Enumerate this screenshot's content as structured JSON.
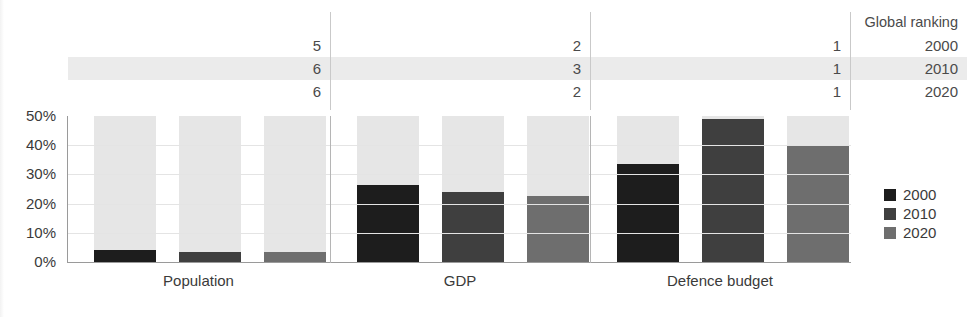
{
  "ranking_table": {
    "header_label": "Global ranking",
    "row_labels": [
      "2000",
      "2010",
      "2020"
    ],
    "highlight_row_index": 1,
    "highlight_color": "#ebebeb",
    "columns": [
      {
        "category": "Population",
        "values": [
          "5",
          "6",
          "6"
        ]
      },
      {
        "category": "GDP",
        "values": [
          "2",
          "3",
          "2"
        ]
      },
      {
        "category": "Defence budget",
        "values": [
          "1",
          "1",
          "1"
        ]
      }
    ]
  },
  "legend": {
    "position": "right",
    "items": [
      {
        "label": "2000",
        "color": "#1d1d1d"
      },
      {
        "label": "2010",
        "color": "#3f3f3f"
      },
      {
        "label": "2020",
        "color": "#6e6e6e"
      }
    ]
  },
  "chart_data": {
    "type": "bar",
    "title": "",
    "subtitle": "",
    "xlabel": "",
    "ylabel": "",
    "categories": [
      "Population",
      "GDP",
      "Defence budget"
    ],
    "series": [
      {
        "name": "2000",
        "color": "#1d1d1d",
        "values": [
          4,
          26.5,
          33.5
        ]
      },
      {
        "name": "2010",
        "color": "#3f3f3f",
        "values": [
          3.5,
          24,
          49
        ]
      },
      {
        "name": "2020",
        "color": "#6e6e6e",
        "values": [
          3.5,
          22.5,
          40
        ]
      }
    ],
    "unit": "%",
    "ylim": [
      0,
      50
    ],
    "yticks": [
      0,
      10,
      20,
      30,
      40,
      50
    ],
    "ytick_labels": [
      "0%",
      "10%",
      "20%",
      "30%",
      "40%",
      "50%"
    ],
    "grid": true,
    "grid_axis": "y",
    "bar_background_color": "#e6e6e6",
    "legend_position": "right"
  }
}
